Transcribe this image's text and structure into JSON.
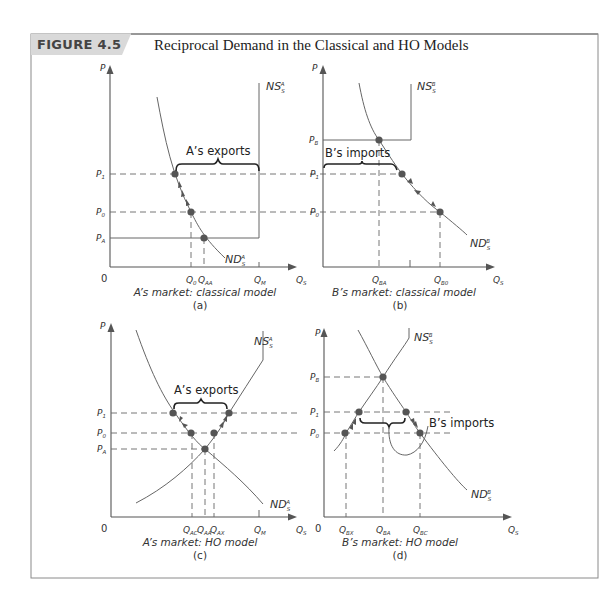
{
  "figure": {
    "badge": "FIGURE 4.5",
    "title": "Reciprocal Demand in the Classical and HO Models"
  },
  "panels": {
    "a": {
      "caption_line1": "A’s market: classical model",
      "caption_letter": "(a)",
      "y_axis_label": "P",
      "x_axis_label": "Q",
      "x_axis_sub": "S",
      "origin": "0",
      "supply_label": "NS",
      "supply_sub": "S",
      "supply_sup": "A",
      "demand_label": "ND",
      "demand_sub": "S",
      "demand_sup": "A",
      "annotation": "A’s exports",
      "price_labels": [
        {
          "main": "P",
          "sub": "1"
        },
        {
          "main": "P",
          "sub": "0"
        },
        {
          "main": "P",
          "sub": "A"
        }
      ],
      "quantity_labels": [
        {
          "main": "Q",
          "sub": "0"
        },
        {
          "main": "Q",
          "sub": "AA"
        },
        {
          "main": "Q",
          "sub": "M"
        }
      ]
    },
    "b": {
      "caption_line1": "B’s market: classical model",
      "caption_letter": "(b)",
      "y_axis_label": "P",
      "x_axis_label": "Q",
      "x_axis_sub": "S",
      "supply_label": "NS",
      "supply_sub": "S",
      "supply_sup": "B",
      "demand_label": "ND",
      "demand_sub": "S",
      "demand_sup": "B",
      "annotation": "B’s imports",
      "price_labels": [
        {
          "main": "P",
          "sub": "B"
        },
        {
          "main": "P",
          "sub": "1"
        },
        {
          "main": "P",
          "sub": "0"
        }
      ],
      "quantity_labels": [
        {
          "main": "Q",
          "sub": "BA"
        },
        {
          "main": "Q",
          "sub": "B0"
        }
      ]
    },
    "c": {
      "caption_line1": "A’s market: HO model",
      "caption_letter": "(c)",
      "y_axis_label": "P",
      "x_axis_label": "Q",
      "x_axis_sub": "S",
      "origin": "0",
      "supply_label": "NS",
      "supply_sub": "S",
      "supply_sup": "A",
      "demand_label": "ND",
      "demand_sub": "S",
      "demand_sup": "A",
      "annotation": "A’s exports",
      "price_labels": [
        {
          "main": "P",
          "sub": "1"
        },
        {
          "main": "P",
          "sub": "0"
        },
        {
          "main": "P",
          "sub": "A"
        }
      ],
      "quantity_labels": [
        {
          "main": "Q",
          "sub": "AC"
        },
        {
          "main": "Q",
          "sub": "AA"
        },
        {
          "main": "Q",
          "sub": "AX"
        },
        {
          "main": "Q",
          "sub": "M"
        }
      ]
    },
    "d": {
      "caption_line1": "B’s market: HO model",
      "caption_letter": "(d)",
      "y_axis_label": "P",
      "x_axis_label": "Q",
      "x_axis_sub": "S",
      "origin": "0",
      "supply_label": "NS",
      "supply_sub": "S",
      "supply_sup": "B",
      "demand_label": "ND",
      "demand_sub": "S",
      "demand_sup": "B",
      "annotation": "B’s imports",
      "price_labels": [
        {
          "main": "P",
          "sub": "B"
        },
        {
          "main": "P",
          "sub": "1"
        },
        {
          "main": "P",
          "sub": "0"
        }
      ],
      "quantity_labels": [
        {
          "main": "Q",
          "sub": "BX"
        },
        {
          "main": "Q",
          "sub": "BA"
        },
        {
          "main": "Q",
          "sub": "BC"
        }
      ]
    }
  },
  "colors": {
    "frame": "#888888",
    "badge_bg": "#d9d9d9",
    "lines": "#666666",
    "dots": "#555555",
    "brace": "#222222"
  }
}
